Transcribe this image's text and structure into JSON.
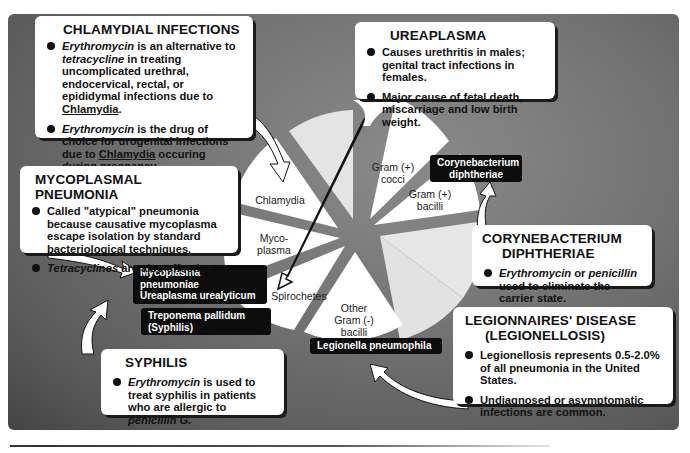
{
  "colors": {
    "panel_bg": "#767676",
    "wedge_white": "#ffffff",
    "wedge_light": "#e4e4e4",
    "tag_bg": "#0c0c0c",
    "tag_text": "#ffffff"
  },
  "pie": {
    "center": [
      347,
      218
    ],
    "wedges": [
      {
        "label": "Gram (+)\ncocci",
        "label_lines": [
          "Gram (+)",
          "cocci"
        ],
        "shade": "white"
      },
      {
        "label": "Gram (+)\nbacilli",
        "label_lines": [
          "Gram (+)",
          "bacilli"
        ],
        "shade": "white"
      },
      {
        "label": "",
        "label_lines": [],
        "shade": "light"
      },
      {
        "label": "",
        "label_lines": [],
        "shade": "light"
      },
      {
        "label": "Other\nGram (-)\nbacilli",
        "label_lines": [
          "Other",
          "Gram (-)",
          "bacilli"
        ],
        "shade": "white"
      },
      {
        "label": "Spirochetes",
        "label_lines": [
          "Spirochetes"
        ],
        "shade": "white"
      },
      {
        "label": "Myco-\nplasma",
        "label_lines": [
          "Myco-",
          "plasma"
        ],
        "shade": "white"
      },
      {
        "label": "Chlamydia",
        "label_lines": [
          "Chlamydia"
        ],
        "shade": "white"
      },
      {
        "label": "",
        "label_lines": [],
        "shade": "light"
      }
    ]
  },
  "wedge_labels": {
    "gram_pos_cocci": [
      "Gram (+)",
      "cocci"
    ],
    "gram_pos_bacilli": [
      "Gram (+)",
      "bacilli"
    ],
    "other_gram_neg_bacilli": [
      "Other",
      "Gram (-)",
      "bacilli"
    ],
    "spirochetes": "Spirochetes",
    "mycoplasma": [
      "Myco-",
      "plasma"
    ],
    "chlamydia": "Chlamydia"
  },
  "tags": {
    "corynebacterium": [
      "Corynebacterium",
      "diphtheriae"
    ],
    "mycoplasma": [
      "Mycoplasma pneumoniae",
      "Ureaplasma urealyticum"
    ],
    "treponema": "Treponema pallidum (Syphilis)",
    "legionella": "Legionella pneumophila"
  },
  "callouts": {
    "chlamydial": {
      "title": "CHLAMYDIAL INFECTIONS",
      "bullets": [
        {
          "parts": [
            {
              "text": "Erythromycin",
              "style": "italic"
            },
            {
              "text": " is an alternative to ",
              "style": "normal"
            },
            {
              "text": "tetracycline",
              "style": "italic"
            },
            {
              "text": " in treating uncomplicated urethral, endocervical, rectal, or epididymal infections due to ",
              "style": "normal"
            },
            {
              "text": "Chlamydia",
              "style": "underline"
            },
            {
              "text": ".",
              "style": "normal"
            }
          ]
        },
        {
          "parts": [
            {
              "text": "Erythromycin",
              "style": "italic"
            },
            {
              "text": " is the drug of choice for urogenital infections due to ",
              "style": "normal"
            },
            {
              "text": "Chlamydia",
              "style": "underline"
            },
            {
              "text": " occuring during pregnancy.",
              "style": "normal"
            }
          ]
        }
      ]
    },
    "ureaplasma": {
      "title": "UREAPLASMA",
      "bullets": [
        {
          "parts": [
            {
              "text": "Causes urethritis in males; genital tract infections in females.",
              "style": "normal"
            }
          ]
        },
        {
          "parts": [
            {
              "text": "Major cause of fetal death, miscarriage and low birth weight.",
              "style": "normal"
            }
          ]
        }
      ]
    },
    "mycoplasmal": {
      "title": "MYCOPLASMAL PNEUMONIA",
      "bullets": [
        {
          "parts": [
            {
              "text": "Called \"atypical\" pneumonia because causative mycoplasma escape isolation by standard  bacteriological techniques.",
              "style": "normal"
            }
          ]
        },
        {
          "parts": [
            {
              "text": "Tetracyclines",
              "style": "italic"
            },
            {
              "text": " are also effective.",
              "style": "normal"
            }
          ]
        }
      ]
    },
    "corynebacterium": {
      "title_lines": [
        "CORYNEBACTERIUM",
        "DIPHTHERIAE"
      ],
      "bullets": [
        {
          "parts": [
            {
              "text": "Erythromycin",
              "style": "italic"
            },
            {
              "text": " or ",
              "style": "normal"
            },
            {
              "text": "penicillin",
              "style": "italic"
            },
            {
              "text": " used to eliminate the carrier state.",
              "style": "normal"
            }
          ]
        }
      ]
    },
    "legionnaires": {
      "title_lines": [
        "LEGIONNAIRES' DISEASE",
        "(LEGIONELLOSIS)"
      ],
      "bullets": [
        {
          "parts": [
            {
              "text": "Legionellosis represents 0.5-2.0% of all pneumonia in the United States.",
              "style": "normal"
            }
          ]
        },
        {
          "parts": [
            {
              "text": "Undiagnosed or asymptomatic infections are common.",
              "style": "normal"
            }
          ]
        }
      ]
    },
    "syphilis": {
      "title": "SYPHILIS",
      "bullets": [
        {
          "parts": [
            {
              "text": "Erythromycin",
              "style": "italic"
            },
            {
              "text": " is used to treat syphilis in patients who are allergic to ",
              "style": "normal"
            },
            {
              "text": "penicillin G.",
              "style": "italic"
            }
          ]
        }
      ]
    }
  }
}
